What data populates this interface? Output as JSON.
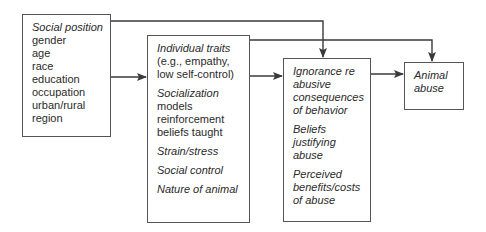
{
  "diagram": {
    "boxes": {
      "social_position": {
        "title": "Social position",
        "items": [
          "gender",
          "age",
          "race",
          "education",
          "occupation",
          "urban/rural",
          "region"
        ]
      },
      "intermediate": {
        "groups": [
          {
            "title": "Individual traits",
            "lines": [
              "(e.g., empathy,",
              "low self-control)"
            ]
          },
          {
            "title": "Socialization",
            "lines": [
              "models",
              "reinforcement",
              "beliefs taught"
            ]
          },
          {
            "title": "Strain/stress",
            "lines": []
          },
          {
            "title": "Social control",
            "lines": []
          },
          {
            "title": "Nature of animal",
            "lines": []
          }
        ]
      },
      "proximate": {
        "groups": [
          {
            "lines": [
              "Ignorance re",
              "abusive",
              "consequences",
              "of behavior"
            ]
          },
          {
            "lines": [
              "Beliefs",
              "justifying",
              "abuse"
            ]
          },
          {
            "lines": [
              "Perceived",
              "benefits/costs",
              "of abuse"
            ]
          }
        ]
      },
      "outcome": {
        "lines": [
          "Animal",
          "abuse"
        ]
      }
    },
    "edges": [
      {
        "from": "social_position",
        "to": "intermediate"
      },
      {
        "from": "social_position",
        "to": "proximate"
      },
      {
        "from": "intermediate",
        "to": "proximate"
      },
      {
        "from": "intermediate",
        "to": "outcome"
      },
      {
        "from": "proximate",
        "to": "outcome"
      }
    ],
    "colors": {
      "line": "#3a3a3a",
      "border": "#555555",
      "text": "#2a2a2a"
    }
  }
}
